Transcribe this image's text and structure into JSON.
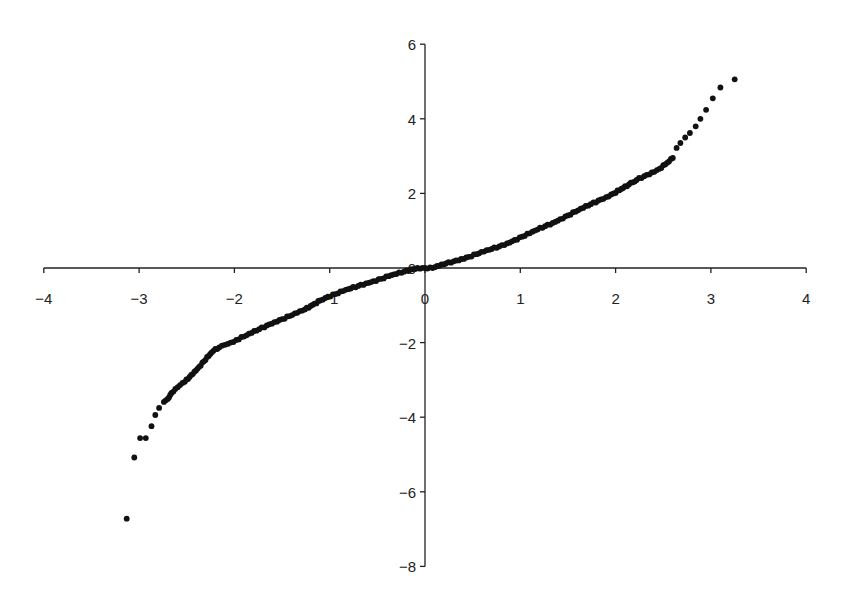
{
  "chart_data": {
    "type": "scatter",
    "title": "",
    "xlabel": "",
    "ylabel": "",
    "xlim": [
      -4,
      4
    ],
    "ylim": [
      -8,
      6
    ],
    "grid": false,
    "legend": null,
    "x_ticks": [
      "−4",
      "−3",
      "−2",
      "−1",
      "0",
      "1",
      "2",
      "3",
      "4"
    ],
    "x_tick_values": [
      -4,
      -3,
      -2,
      -1,
      0,
      1,
      2,
      3,
      4
    ],
    "y_ticks": [
      "6",
      "4",
      "2",
      "0",
      "−2",
      "−4",
      "−6",
      "−8"
    ],
    "y_tick_values": [
      6,
      4,
      2,
      0,
      -2,
      -4,
      -6,
      -8
    ],
    "marker_color": "#111111",
    "axis_color": "#222222",
    "series": [
      {
        "name": "quantile points",
        "points": [
          [
            -3.13,
            -6.72
          ],
          [
            -3.05,
            -5.08
          ],
          [
            -2.99,
            -4.56
          ],
          [
            -2.93,
            -4.56
          ],
          [
            -2.87,
            -4.24
          ],
          [
            -2.83,
            -3.94
          ],
          [
            -2.79,
            -3.75
          ],
          [
            -2.74,
            -3.59
          ],
          [
            -2.7,
            -3.51
          ],
          [
            -2.66,
            -3.35
          ],
          [
            -2.62,
            -3.24
          ],
          [
            -2.57,
            -3.14
          ],
          [
            -2.52,
            -3.05
          ],
          [
            -2.47,
            -2.92
          ],
          [
            -2.42,
            -2.78
          ],
          [
            -2.37,
            -2.65
          ],
          [
            -2.32,
            -2.5
          ],
          [
            -2.27,
            -2.36
          ],
          [
            -2.22,
            -2.22
          ],
          [
            -2.16,
            -2.13
          ],
          [
            -2.1,
            -2.06
          ],
          [
            -2.04,
            -2.0
          ],
          [
            -1.98,
            -1.93
          ],
          [
            -1.9,
            -1.84
          ],
          [
            -1.82,
            -1.74
          ],
          [
            -1.74,
            -1.64
          ],
          [
            -1.66,
            -1.54
          ],
          [
            -1.58,
            -1.45
          ],
          [
            -1.5,
            -1.37
          ],
          [
            -1.42,
            -1.29
          ],
          [
            -1.34,
            -1.2
          ],
          [
            -1.26,
            -1.11
          ],
          [
            -1.18,
            -0.99
          ],
          [
            -1.1,
            -0.87
          ],
          [
            -1.02,
            -0.77
          ],
          [
            -0.94,
            -0.7
          ],
          [
            -0.86,
            -0.62
          ],
          [
            -0.78,
            -0.55
          ],
          [
            -0.7,
            -0.48
          ],
          [
            -0.62,
            -0.41
          ],
          [
            -0.54,
            -0.35
          ],
          [
            -0.46,
            -0.29
          ],
          [
            -0.38,
            -0.22
          ],
          [
            -0.3,
            -0.16
          ],
          [
            -0.22,
            -0.1
          ],
          [
            -0.15,
            -0.04
          ],
          [
            -0.08,
            0.0
          ],
          [
            0.0,
            0.0
          ],
          [
            0.08,
            0.0
          ],
          [
            0.15,
            0.06
          ],
          [
            0.22,
            0.12
          ],
          [
            0.3,
            0.18
          ],
          [
            0.38,
            0.24
          ],
          [
            0.46,
            0.3
          ],
          [
            0.54,
            0.37
          ],
          [
            0.62,
            0.44
          ],
          [
            0.7,
            0.51
          ],
          [
            0.78,
            0.58
          ],
          [
            0.86,
            0.66
          ],
          [
            0.94,
            0.75
          ],
          [
            1.02,
            0.84
          ],
          [
            1.1,
            0.93
          ],
          [
            1.18,
            1.03
          ],
          [
            1.26,
            1.12
          ],
          [
            1.34,
            1.21
          ],
          [
            1.42,
            1.31
          ],
          [
            1.5,
            1.41
          ],
          [
            1.58,
            1.51
          ],
          [
            1.66,
            1.61
          ],
          [
            1.74,
            1.71
          ],
          [
            1.82,
            1.81
          ],
          [
            1.9,
            1.9
          ],
          [
            1.98,
            2.0
          ],
          [
            2.06,
            2.12
          ],
          [
            2.14,
            2.24
          ],
          [
            2.22,
            2.36
          ],
          [
            2.3,
            2.46
          ],
          [
            2.38,
            2.56
          ],
          [
            2.46,
            2.66
          ],
          [
            2.54,
            2.82
          ],
          [
            2.6,
            2.95
          ],
          [
            2.64,
            3.22
          ],
          [
            2.68,
            3.35
          ],
          [
            2.73,
            3.5
          ],
          [
            2.78,
            3.62
          ],
          [
            2.84,
            3.8
          ],
          [
            2.89,
            4.0
          ],
          [
            2.95,
            4.24
          ],
          [
            3.02,
            4.55
          ],
          [
            3.1,
            4.84
          ],
          [
            3.25,
            5.06
          ]
        ]
      }
    ]
  }
}
